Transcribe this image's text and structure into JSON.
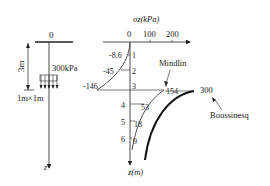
{
  "left_panel": {
    "origin_label": "0",
    "depth_label": "3m",
    "load_label": "300kPa",
    "footing_label": "1m×1m",
    "axis_label": "z"
  },
  "right_panel": {
    "stress_axis_title": "σz(kPa)",
    "stress_ticks": [
      "0",
      "100",
      "200"
    ],
    "depth_axis_label": "z(m)",
    "depth_ticks": [
      "1",
      "2",
      "3",
      "4",
      "5",
      "6"
    ],
    "mindlin_label": "Mindlin",
    "boussinesq_label": "Boussinesq",
    "mindlin_values": [
      "-8.6",
      "-45",
      "-146",
      "154",
      "53",
      "18",
      "9"
    ],
    "boussinesq_peak": "300"
  },
  "colors": {
    "line": "#222222",
    "background": "#ffffff"
  }
}
